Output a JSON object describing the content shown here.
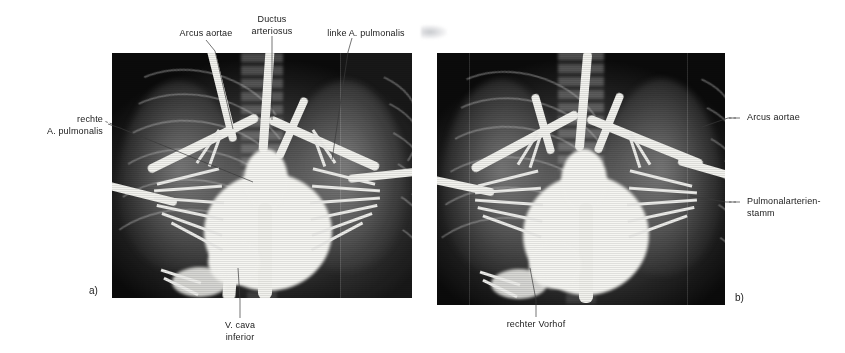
{
  "figure": {
    "type": "angiography-xray-figure",
    "panel_a": {
      "tag": "a)"
    },
    "panel_b": {
      "tag": "b)"
    }
  },
  "labels": {
    "arcus_aortae_a": "Arcus aortae",
    "ductus_arteriosus": "Ductus\narteriosus",
    "linke_a_pulmonalis": "linke A. pulmonalis",
    "rechte_a_pulmonalis": "rechte\nA. pulmonalis",
    "v_cava_inferior": "V. cava\ninferior",
    "arcus_aortae_b": "Arcus aortae",
    "pulmonalarterienstamm": "Pulmonalarterien-\nstamm",
    "rechter_vorhof": "rechter Vorhof"
  },
  "colors": {
    "text": "#1a1a1a",
    "leader": "#3a3a3a",
    "page_background": "#ffffff",
    "film_dark": "#0b0b0b",
    "contrast_vessel": "#f2f2ee"
  }
}
